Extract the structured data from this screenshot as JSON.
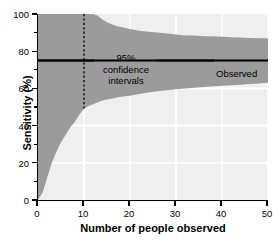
{
  "chart_data": {
    "type": "area",
    "title": "",
    "subtitle": "",
    "xlabel": "Number of people observed",
    "ylabel": "Sensitivity (%)",
    "xlim": [
      0,
      50
    ],
    "ylim": [
      0,
      100
    ],
    "xticks": [
      0,
      10,
      20,
      30,
      40,
      50
    ],
    "yticks": [
      0,
      20,
      40,
      60,
      80,
      100
    ],
    "y_minor_ticks": [
      10,
      30,
      50,
      70,
      90
    ],
    "grid": "white gridlines on light gray panel, x every 10, y every 20",
    "legend": "none (inline annotations)",
    "observed_value": 75,
    "band_fill_color": "#9b9b9b",
    "panel_color": "#efefef",
    "gridline_color": "#ffffff",
    "line_color": "#000000",
    "x": [
      0,
      1,
      2,
      3,
      4,
      5,
      6,
      7,
      8,
      9,
      10,
      11,
      12,
      13,
      14,
      15,
      16,
      17,
      18,
      19,
      20,
      22,
      24,
      26,
      28,
      30,
      32,
      34,
      36,
      38,
      40,
      42,
      44,
      46,
      48,
      50
    ],
    "series": [
      {
        "name": "Upper 95% confidence limit",
        "values": [
          100,
          100,
          100,
          100,
          100,
          100,
          100,
          100,
          100,
          100,
          100,
          100,
          100,
          99,
          97,
          95.5,
          94.5,
          93.5,
          93,
          92.5,
          92,
          91,
          90.5,
          90,
          89.5,
          89,
          88.5,
          88.5,
          88,
          88,
          87.8,
          87.5,
          87.3,
          87.1,
          87,
          87
        ]
      },
      {
        "name": "Lower 95% confidence limit",
        "values": [
          0,
          4,
          12,
          20,
          26,
          31,
          35,
          39,
          42,
          46,
          49,
          50.5,
          51.5,
          52.5,
          53.5,
          54,
          54.5,
          55,
          55.5,
          55.8,
          56,
          57,
          57.8,
          58.5,
          59,
          59.5,
          60,
          60.4,
          60.8,
          61.1,
          61.4,
          61.7,
          62,
          62.3,
          62.6,
          63
        ]
      },
      {
        "name": "Observed",
        "values": [
          75,
          75,
          75,
          75,
          75,
          75,
          75,
          75,
          75,
          75,
          75,
          75,
          75,
          75,
          75,
          75,
          75,
          75,
          75,
          75,
          75,
          75,
          75,
          75,
          75,
          75,
          75,
          75,
          75,
          75,
          75,
          75,
          75,
          75,
          75,
          75
        ]
      }
    ],
    "annotations": [
      {
        "name": "ci-label",
        "text_lines": [
          "95%",
          "confidence",
          "intervals"
        ],
        "x": 10,
        "y": 82
      },
      {
        "name": "observed-label",
        "text": "Observed",
        "x": 27,
        "y": 75
      },
      {
        "name": "reference-line",
        "text": "dashed vertical line",
        "x": 10,
        "y_from": 49,
        "y_to": 100
      }
    ]
  },
  "axes": {
    "y_title": "Sensitivity (%)",
    "x_title": "Number of people observed",
    "y_tick_labels": [
      "0",
      "20",
      "40",
      "60",
      "80",
      "100"
    ],
    "x_tick_labels": [
      "0",
      "10",
      "20",
      "30",
      "40",
      "50"
    ]
  },
  "annotations": {
    "ci_line1": "95%",
    "ci_line2": "confidence",
    "ci_line3": "intervals",
    "observed": "Observed"
  }
}
